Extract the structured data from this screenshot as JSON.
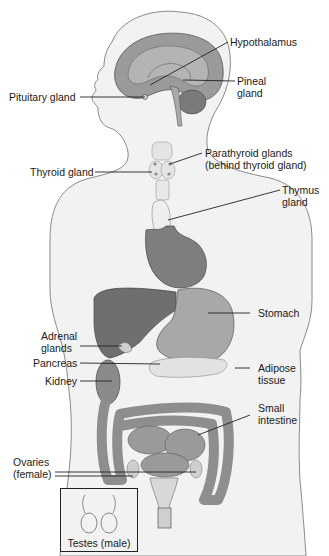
{
  "diagram": {
    "colors": {
      "background": "#ffffff",
      "body_fill": "#f0f0f0",
      "body_outline": "#8a8a8a",
      "organ_dark": "#7d7d7d",
      "organ_mid": "#9c9c9c",
      "organ_light": "#bdbdbd",
      "gland_light": "#e6e6e6",
      "leader_line": "#222222",
      "text": "#1a1a1a"
    },
    "labels": {
      "hypothalamus": "Hypothalamus",
      "pineal_1": "Pineal",
      "pineal_2": "gland",
      "pituitary": "Pituitary gland",
      "thyroid": "Thyroid gland",
      "parathyroid_1": "Parathyroid glands",
      "parathyroid_2": "(behind thyroid gland)",
      "thymus_1": "Thymus",
      "thymus_2": "gland",
      "stomach": "Stomach",
      "adrenal_1": "Adrenal",
      "adrenal_2": "glands",
      "pancreas": "Pancreas",
      "kidney": "Kidney",
      "adipose_1": "Adipose",
      "adipose_2": "tissue",
      "small_intestine_1": "Small",
      "small_intestine_2": "intestine",
      "ovaries_1": "Ovaries",
      "ovaries_2": "(female)",
      "testes": "Testes (male)"
    }
  }
}
